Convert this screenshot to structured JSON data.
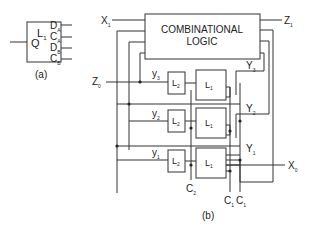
{
  "figure_a": {
    "latch_label": "L",
    "latch_sub": "1",
    "output": "Q",
    "inputs": [
      {
        "main": "D",
        "sub": "A"
      },
      {
        "main": "C",
        "sub": "A"
      },
      {
        "main": "D",
        "sub": "B"
      },
      {
        "main": "C",
        "sub": "B"
      }
    ],
    "caption": "(a)"
  },
  "figure_b": {
    "logic_block": {
      "line1": "COMBINATIONAL",
      "line2": "LOGIC"
    },
    "inputs": {
      "x1": {
        "main": "X",
        "sub": "1"
      },
      "z0": {
        "main": "Z",
        "sub": "0"
      }
    },
    "outputs": {
      "z1": {
        "main": "Z",
        "sub": "1"
      },
      "x0": {
        "main": "X",
        "sub": "0"
      }
    },
    "state_inputs": [
      {
        "main": "y",
        "sub": "3"
      },
      {
        "main": "y",
        "sub": "2"
      },
      {
        "main": "y",
        "sub": "1"
      }
    ],
    "state_outputs": [
      {
        "main": "Y",
        "sub": "3"
      },
      {
        "main": "Y",
        "sub": "2"
      },
      {
        "main": "Y",
        "sub": "1"
      }
    ],
    "latches": [
      {
        "l2": "L",
        "l2_sub": "2",
        "l1": "L",
        "l1_sub": "1"
      },
      {
        "l2": "L",
        "l2_sub": "2",
        "l1": "L",
        "l1_sub": "1"
      },
      {
        "l2": "L",
        "l2_sub": "2",
        "l1": "L",
        "l1_sub": "1"
      }
    ],
    "clocks": [
      {
        "main": "C",
        "sub": "2"
      },
      {
        "main": "C",
        "sub": "1"
      },
      {
        "main": "C",
        "sub": "1"
      }
    ],
    "caption": "(b)"
  }
}
